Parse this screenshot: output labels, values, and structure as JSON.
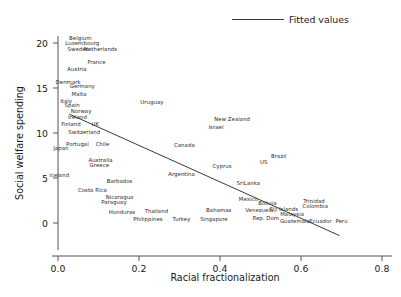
{
  "chart_data": {
    "type": "scatter",
    "title": "",
    "xlabel": "Racial fractionalization",
    "ylabel": "Social welfare spending",
    "xlim": [
      -0.04,
      0.84
    ],
    "ylim": [
      -2.2,
      21.3
    ],
    "xticks": [
      "0.0",
      "0.2",
      "0.4",
      "0.6",
      "0.8"
    ],
    "xtick_values": [
      0.0,
      0.2,
      0.4,
      0.6,
      0.8
    ],
    "yticks": [
      "0",
      "5",
      "10",
      "15",
      "20"
    ],
    "ytick_values": [
      0,
      5,
      10,
      15,
      20
    ],
    "grid": false,
    "legend": {
      "position": "top-right",
      "entries": [
        "Fitted values"
      ]
    },
    "marker_style": "text-labels-only",
    "series": [
      {
        "name": "Countries",
        "points": [
          {
            "label": "Belgium",
            "x": 0.055,
            "y": 20.6
          },
          {
            "label": "Luxembourg",
            "x": 0.06,
            "y": 20.0
          },
          {
            "label": "Sweden",
            "x": 0.05,
            "y": 19.3
          },
          {
            "label": "Netherlands",
            "x": 0.105,
            "y": 19.3
          },
          {
            "label": "France",
            "x": 0.095,
            "y": 17.9
          },
          {
            "label": "Austria",
            "x": 0.047,
            "y": 17.1
          },
          {
            "label": "Denmark",
            "x": 0.025,
            "y": 15.7
          },
          {
            "label": "Germany",
            "x": 0.06,
            "y": 15.2
          },
          {
            "label": "Malta",
            "x": 0.052,
            "y": 14.3
          },
          {
            "label": "Italy",
            "x": 0.02,
            "y": 13.6
          },
          {
            "label": "Uruguay",
            "x": 0.232,
            "y": 13.4
          },
          {
            "label": "Spain",
            "x": 0.035,
            "y": 13.1
          },
          {
            "label": "Norway",
            "x": 0.057,
            "y": 12.4
          },
          {
            "label": "Ireland",
            "x": 0.048,
            "y": 11.8
          },
          {
            "label": "New Zealand",
            "x": 0.43,
            "y": 11.6
          },
          {
            "label": "Finland",
            "x": 0.032,
            "y": 11.0
          },
          {
            "label": "UK",
            "x": 0.092,
            "y": 11.0
          },
          {
            "label": "Israel",
            "x": 0.39,
            "y": 10.7
          },
          {
            "label": "Switzerland",
            "x": 0.065,
            "y": 10.1
          },
          {
            "label": "Portugal",
            "x": 0.048,
            "y": 8.8
          },
          {
            "label": "Chile",
            "x": 0.11,
            "y": 8.8
          },
          {
            "label": "Canada",
            "x": 0.312,
            "y": 8.7
          },
          {
            "label": "Japan",
            "x": 0.007,
            "y": 8.3
          },
          {
            "label": "Brazil",
            "x": 0.545,
            "y": 7.4
          },
          {
            "label": "Australia",
            "x": 0.105,
            "y": 7.0
          },
          {
            "label": "US",
            "x": 0.508,
            "y": 6.8
          },
          {
            "label": "Greece",
            "x": 0.102,
            "y": 6.5
          },
          {
            "label": "Cyprus",
            "x": 0.405,
            "y": 6.3
          },
          {
            "label": "Iceland",
            "x": 0.003,
            "y": 5.3
          },
          {
            "label": "Argentina",
            "x": 0.305,
            "y": 5.5
          },
          {
            "label": "Barbados",
            "x": 0.152,
            "y": 4.7
          },
          {
            "label": "SriLanka",
            "x": 0.47,
            "y": 4.5
          },
          {
            "label": "Costa Rica",
            "x": 0.085,
            "y": 3.7
          },
          {
            "label": "Nicaragua",
            "x": 0.152,
            "y": 2.9
          },
          {
            "label": "Mexico",
            "x": 0.47,
            "y": 2.7
          },
          {
            "label": "Paraguay",
            "x": 0.138,
            "y": 2.3
          },
          {
            "label": "Bolivia",
            "x": 0.517,
            "y": 2.2
          },
          {
            "label": "Trinidad",
            "x": 0.632,
            "y": 2.4
          },
          {
            "label": "Colombia",
            "x": 0.635,
            "y": 1.9
          },
          {
            "label": "Fiji Islands",
            "x": 0.558,
            "y": 1.6
          },
          {
            "label": "Venezuela",
            "x": 0.497,
            "y": 1.4
          },
          {
            "label": "Bahamas",
            "x": 0.397,
            "y": 1.5
          },
          {
            "label": "Thailand",
            "x": 0.243,
            "y": 1.3
          },
          {
            "label": "Honduras",
            "x": 0.158,
            "y": 1.2
          },
          {
            "label": "Malaysia",
            "x": 0.578,
            "y": 1.0
          },
          {
            "label": "Rep. Dom",
            "x": 0.513,
            "y": 0.6
          },
          {
            "label": "Singapore",
            "x": 0.385,
            "y": 0.5
          },
          {
            "label": "Turkey",
            "x": 0.305,
            "y": 0.5
          },
          {
            "label": "Philippines",
            "x": 0.222,
            "y": 0.4
          },
          {
            "label": "Guatemala",
            "x": 0.585,
            "y": 0.2
          },
          {
            "label": "Ecuador",
            "x": 0.648,
            "y": 0.2
          },
          {
            "label": "Peru",
            "x": 0.7,
            "y": 0.2
          }
        ]
      }
    ],
    "fitted_line": {
      "name": "Fitted values",
      "x_start": 0.028,
      "y_start": 12.1,
      "x_end": 0.695,
      "y_end": -1.4,
      "color": "#3a3a3a"
    }
  }
}
